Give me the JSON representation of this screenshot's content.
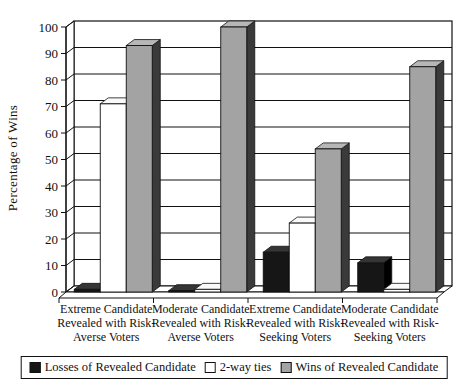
{
  "chart_data": {
    "type": "bar",
    "style": "3d-grouped-column",
    "title": "",
    "ylabel": "Percentage of Wins",
    "xlabel": "",
    "ylim": [
      0,
      100
    ],
    "ytick_step": 10,
    "yticks": [
      0,
      10,
      20,
      30,
      40,
      50,
      60,
      70,
      80,
      90,
      100
    ],
    "grid": true,
    "legend_position": "bottom",
    "categories": [
      "Extreme Candidate Revealed with Risk-Averse Voters",
      "Moderate Candidate Revealed with Risk-Averse Voters",
      "Extreme Candidate Revealed with Risk-Seeking Voters",
      "Moderate Candidate Revealed with Risk-Seeking Voters"
    ],
    "category_lines": [
      [
        "Extreme Candidate",
        "Revealed with Risk-",
        "Averse Voters"
      ],
      [
        "Moderate Candidate",
        "Revealed with Risk-",
        "Averse Voters"
      ],
      [
        "Extreme Candidate",
        "Revealed with Risk-",
        "Seeking Voters"
      ],
      [
        "Moderate Candidate",
        "Revealed with Risk-",
        "Seeking Voters"
      ]
    ],
    "series": [
      {
        "name": "Losses of Revealed Candidate",
        "values": [
          1,
          0.5,
          15,
          11
        ],
        "front": "#161616",
        "top": "#353535",
        "side": "#000000"
      },
      {
        "name": "2-way ties",
        "values": [
          71,
          1,
          26,
          1
        ],
        "front": "#ffffff",
        "top": "#fafafa",
        "side": "#d9d9d9"
      },
      {
        "name": "Wins of Revealed Candidate",
        "values": [
          93,
          100,
          54,
          85
        ],
        "front": "#a3a3a3",
        "top": "#b7b7b7",
        "side": "#3a3a3a"
      }
    ],
    "axis_color": "#111111",
    "background": "#ffffff"
  }
}
